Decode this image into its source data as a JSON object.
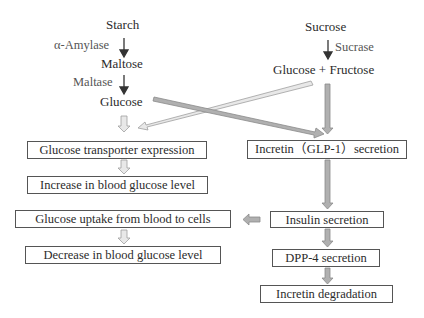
{
  "diagram": {
    "left_pathway": {
      "substrate": "Starch",
      "enzyme1": "α-Amylase",
      "intermediate": "Maltose",
      "enzyme2": "Maltase",
      "product": "Glucose"
    },
    "right_pathway": {
      "substrate": "Sucrose",
      "enzyme": "Sucrase",
      "product": "Glucose + Fructose"
    },
    "boxes": {
      "glucose_transporter": "Glucose transporter expression",
      "increase_blood_glucose": "Increase in blood glucose level",
      "incretin_secretion": "Incretin（GLP-1）secretion",
      "glucose_uptake": "Glucose uptake from blood to cells",
      "decrease_blood_glucose": "Decrease in blood glucose level",
      "insulin_secretion": "Insulin secretion",
      "dpp4_secretion": "DPP-4 secretion",
      "incretin_degradation": "Incretin degradation"
    },
    "colors": {
      "text": "#2b2b2b",
      "enzyme_text": "#555555",
      "box_border": "#555555",
      "light_arrow_fill": "#e6e6e6",
      "light_arrow_stroke": "#a0a0a0",
      "dark_arrow_fill": "#a8a8a8",
      "dark_arrow_stroke": "#8a8a8a"
    }
  }
}
